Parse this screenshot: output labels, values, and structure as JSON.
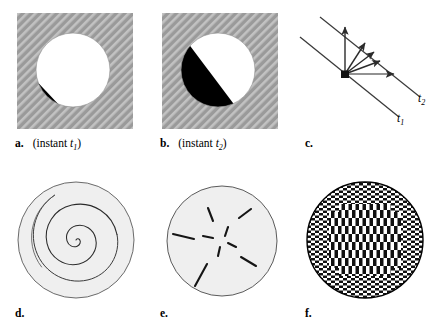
{
  "figure": {
    "width": 437,
    "height": 335,
    "background": "#ffffff"
  },
  "colors": {
    "hatch_background": "#9a9a9a",
    "hatch_line": "#bdbdbd",
    "disk_white": "#ffffff",
    "disk_black": "#000000",
    "circle_fill": "#efefef",
    "circle_stroke": "#555555",
    "line_stroke": "#333333",
    "check_dark": "#111111",
    "check_light": "#ffffff",
    "text": "#000000"
  },
  "panels": [
    {
      "id": "a",
      "label": "a.",
      "caption": "(instant ",
      "caption_var": "t",
      "caption_sub": "1",
      "caption_end": ")",
      "type": "aperture-hatched-disk",
      "description": "grey diagonally hatched square with a white disk bearing a small black sliver at lower-left",
      "black_fraction": 0.12
    },
    {
      "id": "b",
      "label": "b.",
      "caption": "(instant ",
      "caption_var": "t",
      "caption_sub": "2",
      "caption_end": ")",
      "type": "aperture-hatched-disk",
      "description": "grey diagonally hatched square with a disk split diagonally: black lower-left, white upper-right",
      "black_fraction": 0.5
    },
    {
      "id": "c",
      "label": "c.",
      "caption": "",
      "type": "velocity-fan",
      "description": "two parallel oblique lines with a fan of five velocity vectors emanating from a point on the lower line",
      "line_labels": [
        {
          "name": "t",
          "sub": "1"
        },
        {
          "name": "t",
          "sub": "2"
        }
      ],
      "vector_count": 5
    },
    {
      "id": "d",
      "label": "d.",
      "caption": "",
      "type": "spiral-flow",
      "description": "light grey disk containing a logarithmic spiral"
    },
    {
      "id": "e",
      "label": "e.",
      "caption": "",
      "type": "radial-segments",
      "description": "light grey disk containing short radially oriented line segments, longer toward the periphery",
      "segment_count": 9
    },
    {
      "id": "f",
      "label": "f.",
      "caption": "",
      "type": "checkerboard-disk",
      "description": "disk filled with a fine checkerboard whose central region uses taller, vertically elongated checks"
    }
  ]
}
